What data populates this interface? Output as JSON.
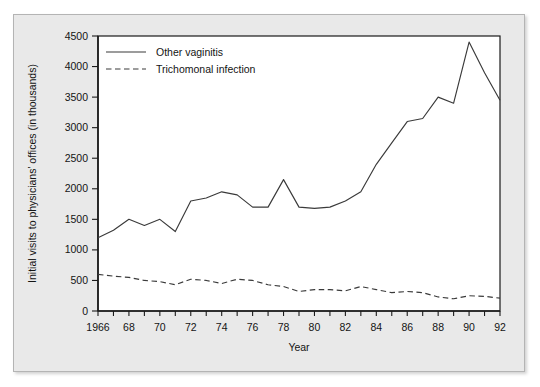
{
  "chart_data": {
    "type": "line",
    "title": "",
    "xlabel": "Year",
    "ylabel": "Initial visits to physicians' offices (in thousands)",
    "xlim": [
      1966,
      1992
    ],
    "ylim": [
      0,
      4500
    ],
    "grid": false,
    "legend_position": "top-left",
    "x": [
      1966,
      1967,
      1968,
      1969,
      1970,
      1971,
      1972,
      1973,
      1974,
      1975,
      1976,
      1977,
      1978,
      1979,
      1980,
      1981,
      1982,
      1983,
      1984,
      1985,
      1986,
      1987,
      1988,
      1989,
      1990,
      1991,
      1992
    ],
    "x_tick_labels": [
      "1966",
      "68",
      "70",
      "72",
      "74",
      "76",
      "78",
      "80",
      "82",
      "84",
      "86",
      "88",
      "90",
      "92"
    ],
    "x_tick_values": [
      1966,
      1968,
      1970,
      1972,
      1974,
      1976,
      1978,
      1980,
      1982,
      1984,
      1986,
      1988,
      1990,
      1992
    ],
    "y_tick_labels": [
      "0",
      "500",
      "1000",
      "1500",
      "2000",
      "2500",
      "3000",
      "3500",
      "4000",
      "4500"
    ],
    "y_tick_values": [
      0,
      500,
      1000,
      1500,
      2000,
      2500,
      3000,
      3500,
      4000,
      4500
    ],
    "series": [
      {
        "name": "Other vaginitis",
        "style": "solid",
        "color": "#3a3a3a",
        "values": [
          1200,
          1320,
          1500,
          1400,
          1500,
          1300,
          1800,
          1850,
          1950,
          1900,
          1700,
          1700,
          2150,
          1700,
          1680,
          1700,
          1800,
          1950,
          2400,
          2750,
          3100,
          3150,
          3500,
          3400,
          4400,
          3900,
          3450
        ]
      },
      {
        "name": "Trichomonal infection",
        "style": "dashed",
        "color": "#3a3a3a",
        "values": [
          600,
          570,
          550,
          500,
          480,
          430,
          520,
          500,
          450,
          520,
          500,
          430,
          400,
          320,
          350,
          350,
          330,
          400,
          350,
          300,
          320,
          300,
          230,
          200,
          250,
          240,
          210
        ]
      }
    ]
  },
  "legend": {
    "items": [
      {
        "label": "Other vaginitis",
        "style": "solid"
      },
      {
        "label": "Trichomonal infection",
        "style": "dashed"
      }
    ]
  }
}
